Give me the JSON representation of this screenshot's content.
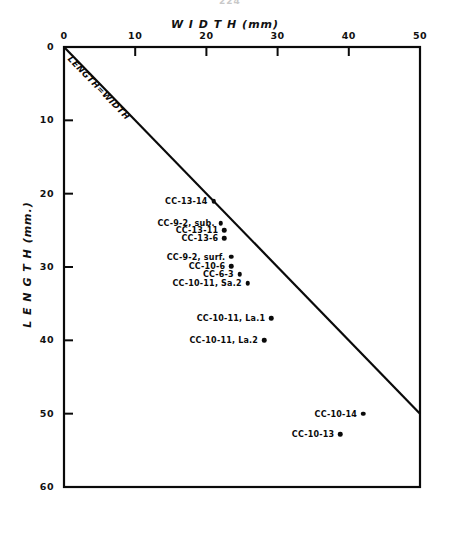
{
  "page": {
    "number": "224"
  },
  "chart_data": {
    "type": "scatter",
    "title": "",
    "xlabel": "W I D T H (mm)",
    "ylabel": "L E N G T H (mm.)",
    "xlim": [
      0,
      50
    ],
    "ylim": [
      0,
      60
    ],
    "y_axis_inverted": true,
    "grid": false,
    "legend": "none",
    "xticks": [
      "0",
      "10",
      "20",
      "30",
      "40",
      "50"
    ],
    "xtick_values": [
      0,
      10,
      20,
      30,
      40,
      50
    ],
    "yticks": [
      "0",
      "10",
      "20",
      "30",
      "40",
      "50",
      "60"
    ],
    "ytick_values": [
      0,
      10,
      20,
      30,
      40,
      50,
      60
    ],
    "reference_line": {
      "label": "LENGTH=WIDTH",
      "from": [
        0,
        0
      ],
      "to": [
        50,
        50
      ]
    },
    "points": [
      {
        "label": "CC-13-14",
        "x": 21.0,
        "y": 21.0
      },
      {
        "label": "CC-9-2, sub.",
        "x": 22.0,
        "y": 24.0
      },
      {
        "label": "CC-13-11",
        "x": 22.5,
        "y": 25.0
      },
      {
        "label": "CC-13-6",
        "x": 22.5,
        "y": 26.1
      },
      {
        "label": "CC-9-2, surf.",
        "x": 23.5,
        "y": 28.6
      },
      {
        "label": "CC-10-6",
        "x": 23.5,
        "y": 29.9
      },
      {
        "label": "CC-6-3",
        "x": 24.7,
        "y": 31.0
      },
      {
        "label": "CC-10-11, Sa.2",
        "x": 25.8,
        "y": 32.2
      },
      {
        "label": "CC-10-11, La.1",
        "x": 29.1,
        "y": 37.0
      },
      {
        "label": "CC-10-11, La.2",
        "x": 28.1,
        "y": 40.0
      },
      {
        "label": "CC-10-14",
        "x": 42.0,
        "y": 50.0
      },
      {
        "label": "CC-10-13",
        "x": 38.8,
        "y": 52.8
      }
    ]
  }
}
